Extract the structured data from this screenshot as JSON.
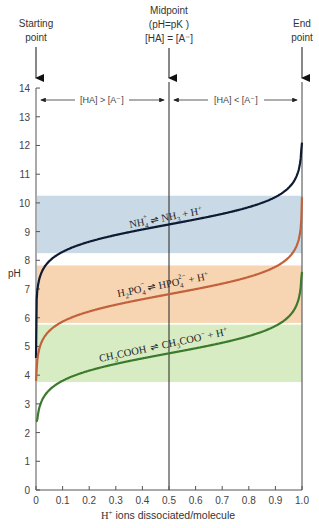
{
  "chart_data": {
    "type": "line",
    "title": "",
    "xlabel": "H+ ions dissociated/molecule",
    "xlabel_parts": {
      "main": "H",
      "sup": "+",
      "rest": " ions dissociated/molecule"
    },
    "ylabel": "pH",
    "xlim": [
      0,
      1.0
    ],
    "ylim": [
      0,
      14
    ],
    "x_ticks": [
      "0",
      "0.1",
      "0.2",
      "0.3",
      "0.4",
      "0.5",
      "0.6",
      "0.7",
      "0.8",
      "0.9",
      "1.0"
    ],
    "y_ticks": [
      "0",
      "1",
      "2",
      "3",
      "4",
      "5",
      "6",
      "7",
      "8",
      "9",
      "10",
      "11",
      "12",
      "13",
      "14"
    ],
    "grid": false,
    "legend": "none (curves labeled inline)",
    "series": [
      {
        "name": "NH4+ ⇌ NH3 + H+",
        "pKa": 9.25,
        "color": "#0f1b33",
        "band": [
          8.25,
          10.25
        ],
        "band_color": "#c9dae6",
        "x": [
          0,
          0.01,
          0.05,
          0.1,
          0.2,
          0.3,
          0.4,
          0.5,
          0.6,
          0.7,
          0.8,
          0.9,
          0.95,
          0.99,
          1.0
        ],
        "values": [
          4.6,
          7.25,
          7.97,
          8.3,
          8.65,
          8.88,
          9.07,
          9.25,
          9.43,
          9.62,
          9.85,
          10.2,
          10.53,
          11.25,
          12.1
        ]
      },
      {
        "name": "H2PO4− ⇌ HPO4 2− + H+",
        "pKa": 6.82,
        "color": "#c2623c",
        "band": [
          5.82,
          7.82
        ],
        "band_color": "#f8d5b2",
        "x": [
          0,
          0.01,
          0.05,
          0.1,
          0.2,
          0.3,
          0.4,
          0.5,
          0.6,
          0.7,
          0.8,
          0.9,
          0.95,
          0.99,
          1.0
        ],
        "values": [
          3.8,
          4.82,
          5.54,
          5.87,
          6.22,
          6.45,
          6.64,
          6.82,
          7.0,
          7.19,
          7.42,
          7.77,
          8.1,
          8.82,
          10.2
        ]
      },
      {
        "name": "CH3COOH ⇌ CH3COO− + H+",
        "pKa": 4.76,
        "color": "#3c7a2e",
        "band": [
          3.76,
          5.76
        ],
        "band_color": "#d7ecc2",
        "x": [
          0,
          0.01,
          0.05,
          0.1,
          0.2,
          0.3,
          0.4,
          0.5,
          0.6,
          0.7,
          0.8,
          0.9,
          0.95,
          0.99,
          1.0
        ],
        "values": [
          2.4,
          2.76,
          3.48,
          3.81,
          4.16,
          4.39,
          4.58,
          4.76,
          4.94,
          5.13,
          5.36,
          5.71,
          6.04,
          6.76,
          7.6
        ]
      }
    ],
    "annotations": {
      "start": {
        "line1": "Starting",
        "line2": "point"
      },
      "mid": {
        "line1": "Midpoint",
        "line2": "(pH=pK )",
        "line3": "[HA] = [A⁻]"
      },
      "end": {
        "line1": "End",
        "line2": "point"
      },
      "left_region": "[HA] > [A⁻]",
      "right_region": "[HA] < [A⁻]"
    },
    "curve_labels": {
      "nh4": {
        "left": "NH",
        "left_sub": "4",
        "left_sup": "+",
        "right": "NH",
        "right_sub": "3",
        "right_tail": " + H",
        "right_sup": "+"
      },
      "h2po4": {
        "left": "H",
        "left_sub": "2",
        "left_mid": "PO",
        "left_sub2": "4",
        "left_sup": "−",
        "right": "HPO",
        "right_sub": "4",
        "right_sup": "2−",
        "right_tail": " + H",
        "right_sup2": "+"
      },
      "acetic": {
        "left": "CH",
        "left_sub": "3",
        "left_mid": "COOH",
        "right": "CH",
        "right_sub": "3",
        "right_mid": "COO",
        "right_sup": "−",
        "right_tail": " + H",
        "right_sup2": "+"
      }
    }
  }
}
